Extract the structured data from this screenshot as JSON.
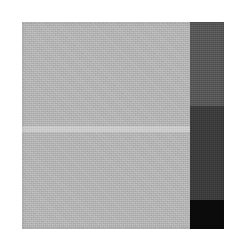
{
  "figure": {
    "canvas": {
      "width": 234,
      "height": 247,
      "background": "#ffffff"
    },
    "plate": {
      "x": 22,
      "y": 22,
      "width": 202,
      "height": 207
    },
    "regions": {
      "light_panel": {
        "name": "light gray panel",
        "color": "#b0b0b0",
        "x": 0,
        "y": 0,
        "width": 168,
        "height": 207
      },
      "light_stripe": {
        "name": "light horizontal stripe",
        "color": "#c9c9c9",
        "x": 0,
        "y": 104,
        "width": 168,
        "height": 6
      },
      "bar_segments": [
        {
          "name": "upper dark gray segment",
          "color": "#555555",
          "top": 0,
          "height": 84
        },
        {
          "name": "middle dark gray segment",
          "color": "#3a3a3a",
          "top": 84,
          "height": 94
        },
        {
          "name": "lower black segment",
          "color": "#0a0a0a",
          "top": 178,
          "height": 29
        }
      ],
      "right_bar": {
        "name": "right vertical tonal bar",
        "x": 168,
        "width": 34
      }
    }
  }
}
